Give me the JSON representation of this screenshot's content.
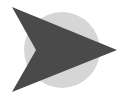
{
  "icon": {
    "name": "arrow-right-icon",
    "colors": {
      "background": "#ffffff",
      "circle": "#d6d6d6",
      "arrow": "#4a4a4a"
    }
  }
}
